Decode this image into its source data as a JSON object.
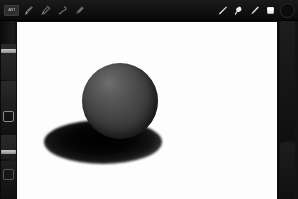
{
  "app": {
    "name": "Sketch Drawing App",
    "theme_bg": "#0d0d0d",
    "canvas_bg": "#fdfdfd"
  },
  "toolbar": {
    "logo_label": "ART",
    "left_tools": [
      {
        "id": "brush",
        "label": "Brush",
        "icon": "brush-icon",
        "active": false
      },
      {
        "id": "pen",
        "label": "Pen",
        "icon": "pen-icon",
        "active": false
      },
      {
        "id": "smudge",
        "label": "Smudge",
        "icon": "smudge-icon",
        "active": false
      },
      {
        "id": "eraser",
        "label": "Eraser",
        "icon": "eraser-icon",
        "active": false
      }
    ],
    "right_tools": [
      {
        "id": "pencil",
        "label": "Pencil",
        "icon": "pencil-icon",
        "active": true
      },
      {
        "id": "blender",
        "label": "Blender",
        "icon": "blender-icon",
        "active": true
      },
      {
        "id": "marker",
        "label": "Marker",
        "icon": "marker-icon",
        "active": true
      },
      {
        "id": "fill",
        "label": "Fill",
        "icon": "fill-square-icon",
        "active": true
      }
    ],
    "color_swatch": {
      "label": "Color",
      "icon": "color-ring-icon",
      "value": "#0b0b0b"
    }
  },
  "left_rail": {
    "items": [
      {
        "id": "size-slider",
        "label": "Brush Size",
        "icon": "slider-icon",
        "value": ""
      },
      {
        "id": "opacity-slider",
        "label": "Opacity",
        "icon": "slider-icon",
        "value": ""
      },
      {
        "id": "shape-tool",
        "label": "Shape",
        "icon": "square-outline-icon",
        "value": ""
      },
      {
        "id": "layer-tool",
        "label": "Layers",
        "icon": "layers-icon",
        "value": ""
      }
    ]
  },
  "right_rail": {
    "items": [
      {
        "id": "panel-top",
        "label": "Panel",
        "icon": "panel-icon"
      },
      {
        "id": "panel-bottom",
        "label": "Options",
        "icon": "options-icon"
      }
    ]
  },
  "canvas": {
    "label": "Drawing Canvas",
    "artwork": {
      "name": "Shaded Sphere",
      "sphere": {
        "cx": 103,
        "cy": 79,
        "r": 38,
        "fill_light": "#6e6e6e",
        "fill_dark": "#1d1d1d"
      },
      "shadow": {
        "cx": 86,
        "cy": 120,
        "rx": 59,
        "ry": 22,
        "fill": "#000000"
      }
    }
  }
}
